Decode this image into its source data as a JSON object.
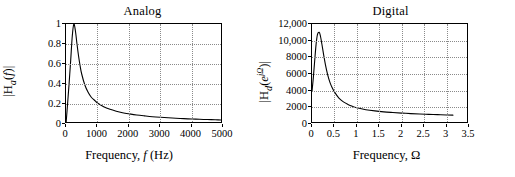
{
  "figure": {
    "background": "#ffffff",
    "curve_color": "#000000",
    "grid_color": "#8a8a8a"
  },
  "panels": [
    {
      "key": "analog",
      "title": "Analog",
      "xaxis_title_parts": {
        "prefix": "Frequency, ",
        "symbol": "f",
        "suffix": " (Hz)"
      },
      "yaxis_title_parts": {
        "open": "|H",
        "sub": "a",
        "mid": "(",
        "var": "f",
        "close": ")|"
      }
    },
    {
      "key": "digital",
      "title": "Digital",
      "xaxis_title_parts": {
        "prefix": "Frequency, ",
        "symbol": "Ω",
        "suffix": ""
      },
      "yaxis_title_parts": {
        "open": "|H",
        "sub": "d",
        "mid": "(",
        "var": "e",
        "exp": "jΩ",
        "close": ")|"
      }
    }
  ],
  "chart_data": [
    {
      "type": "line",
      "key": "analog",
      "title": "Analog",
      "xlabel": "Frequency, f (Hz)",
      "ylabel": "|H_a(f)|",
      "xlim": [
        0,
        5000
      ],
      "ylim": [
        0,
        1
      ],
      "xticks": [
        0,
        1000,
        2000,
        3000,
        4000,
        5000
      ],
      "xticklabels": [
        "0",
        "1000",
        "2000",
        "3000",
        "4000",
        "5000"
      ],
      "yticks": [
        0,
        0.2,
        0.4,
        0.6,
        0.8,
        1
      ],
      "yticklabels": [
        "0",
        "0.2",
        "0.4",
        "0.6",
        "0.8",
        "1"
      ],
      "grid": true,
      "legend": null,
      "peak": {
        "x": 250,
        "y": 1.0
      },
      "x": [
        0,
        50,
        100,
        150,
        200,
        250,
        300,
        350,
        400,
        450,
        500,
        600,
        700,
        800,
        900,
        1000,
        1200,
        1400,
        1600,
        1800,
        2000,
        2250,
        2500,
        2750,
        3000,
        3250,
        3500,
        3750,
        4000,
        4250,
        4500,
        4750,
        5000
      ],
      "y": [
        0.0,
        0.2,
        0.41,
        0.64,
        0.88,
        1.0,
        0.93,
        0.8,
        0.68,
        0.58,
        0.5,
        0.39,
        0.32,
        0.27,
        0.24,
        0.21,
        0.173,
        0.147,
        0.128,
        0.113,
        0.102,
        0.09,
        0.081,
        0.073,
        0.067,
        0.062,
        0.0575,
        0.0535,
        0.05,
        0.047,
        0.0445,
        0.0422,
        0.04
      ]
    },
    {
      "type": "line",
      "key": "digital",
      "title": "Digital",
      "xlabel": "Frequency, Ω",
      "ylabel": "|H_d(e^{jΩ})|",
      "xlim": [
        0,
        3.5
      ],
      "ylim": [
        0,
        12000
      ],
      "xticks": [
        0,
        0.5,
        1,
        1.5,
        2,
        2.5,
        3,
        3.5
      ],
      "xticklabels": [
        "0",
        "0.5",
        "1",
        "1.5",
        "2",
        "2.5",
        "3",
        "3.5"
      ],
      "yticks": [
        0,
        2000,
        4000,
        6000,
        8000,
        10000,
        12000
      ],
      "yticklabels": [
        "0",
        "2000",
        "4000",
        "6000",
        "8000",
        "10,000",
        "12,000"
      ],
      "grid": true,
      "legend": null,
      "peak": {
        "x": 0.16,
        "y": 11000
      },
      "x_end": 3.1416,
      "x": [
        0,
        0.03,
        0.06,
        0.09,
        0.12,
        0.16,
        0.19,
        0.22,
        0.26,
        0.3,
        0.35,
        0.4,
        0.45,
        0.5,
        0.6,
        0.7,
        0.8,
        0.9,
        1.0,
        1.2,
        1.4,
        1.6,
        1.8,
        2.0,
        2.2,
        2.4,
        2.6,
        2.8,
        3.0,
        3.1416
      ],
      "y": [
        3900,
        5600,
        7600,
        9500,
        10700,
        11000,
        10500,
        9600,
        8300,
        7100,
        5900,
        5000,
        4350,
        3850,
        3100,
        2650,
        2350,
        2120,
        1950,
        1720,
        1570,
        1460,
        1380,
        1310,
        1250,
        1200,
        1160,
        1120,
        1080,
        1060
      ]
    }
  ]
}
